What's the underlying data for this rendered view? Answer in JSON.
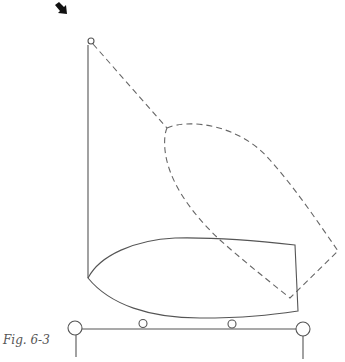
{
  "figure": {
    "caption": "Fig. 6-3",
    "elements": {
      "arrow": {
        "direction": "down-right",
        "color": "#111111"
      },
      "mast_pivot": {
        "shape": "circle"
      },
      "mast_line": {
        "style": "solid"
      },
      "boat_hull": {
        "style": "solid",
        "position": "resting on trailer"
      },
      "tilted_hull": {
        "style": "dashed",
        "position": "raised / tilted"
      },
      "tether_line": {
        "style": "dashed"
      },
      "trailer": {
        "beam": {
          "style": "solid"
        },
        "end_wheels": 2,
        "rollers": 2,
        "posts": 2
      }
    },
    "colors": {
      "line": "#555555",
      "dashed": "#666666",
      "arrow": "#111111",
      "background": "#ffffff"
    }
  }
}
